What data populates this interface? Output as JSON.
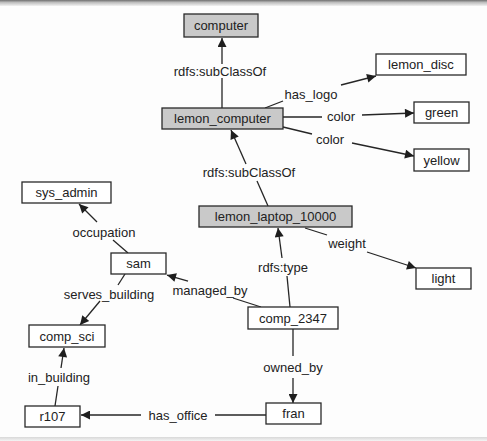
{
  "diagram": {
    "colors": {
      "class_fill": "#c9c9c9",
      "instance_fill": "#ffffff",
      "stroke": "#2a2a2a"
    },
    "nodes": [
      {
        "id": "computer",
        "label": "computer",
        "kind": "class"
      },
      {
        "id": "lemon_computer",
        "label": "lemon_computer",
        "kind": "class"
      },
      {
        "id": "lemon_disc",
        "label": "lemon_disc",
        "kind": "instance"
      },
      {
        "id": "green",
        "label": "green",
        "kind": "instance"
      },
      {
        "id": "yellow",
        "label": "yellow",
        "kind": "instance"
      },
      {
        "id": "lemon_laptop_10000",
        "label": "lemon_laptop_10000",
        "kind": "class"
      },
      {
        "id": "light",
        "label": "light",
        "kind": "instance"
      },
      {
        "id": "sys_admin",
        "label": "sys_admin",
        "kind": "instance"
      },
      {
        "id": "sam",
        "label": "sam",
        "kind": "instance"
      },
      {
        "id": "comp_sci",
        "label": "comp_sci",
        "kind": "instance"
      },
      {
        "id": "r107",
        "label": "r107",
        "kind": "instance"
      },
      {
        "id": "comp_2347",
        "label": "comp_2347",
        "kind": "instance"
      },
      {
        "id": "fran",
        "label": "fran",
        "kind": "instance"
      }
    ],
    "edges": [
      {
        "from": "lemon_computer",
        "to": "computer",
        "label": "rdfs:subClassOf"
      },
      {
        "from": "lemon_computer",
        "to": "lemon_disc",
        "label": "has_logo"
      },
      {
        "from": "lemon_computer",
        "to": "green",
        "label": "color"
      },
      {
        "from": "lemon_computer",
        "to": "yellow",
        "label": "color"
      },
      {
        "from": "lemon_laptop_10000",
        "to": "lemon_computer",
        "label": "rdfs:subClassOf"
      },
      {
        "from": "lemon_laptop_10000",
        "to": "light",
        "label": "weight"
      },
      {
        "from": "comp_2347",
        "to": "lemon_laptop_10000",
        "label": "rdfs:type"
      },
      {
        "from": "comp_2347",
        "to": "sam",
        "label": "managed_by"
      },
      {
        "from": "comp_2347",
        "to": "fran",
        "label": "owned_by"
      },
      {
        "from": "fran",
        "to": "r107",
        "label": "has_office"
      },
      {
        "from": "r107",
        "to": "comp_sci",
        "label": "in_building"
      },
      {
        "from": "sam",
        "to": "comp_sci",
        "label": "serves_building"
      },
      {
        "from": "sam",
        "to": "sys_admin",
        "label": "occupation"
      }
    ]
  }
}
